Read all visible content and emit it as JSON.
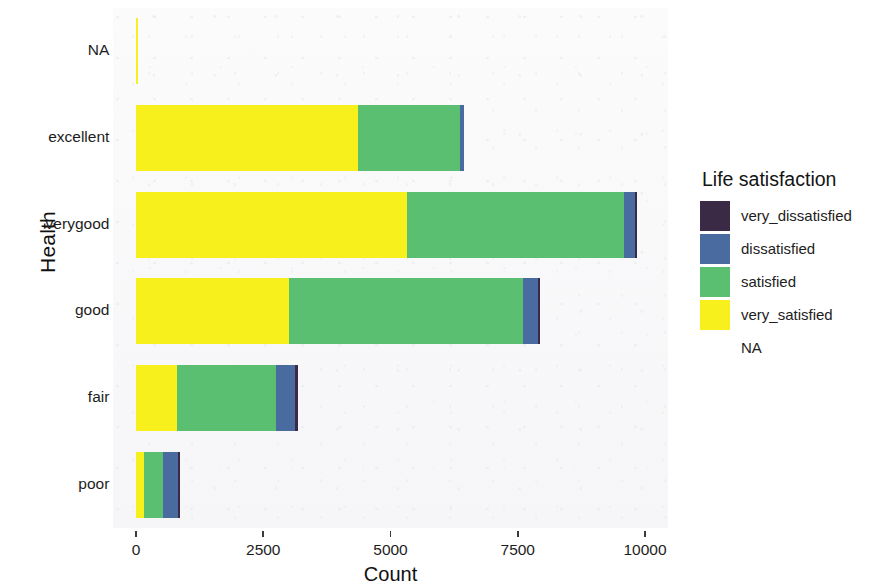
{
  "chart_data": {
    "type": "bar",
    "orientation": "horizontal",
    "stacked": true,
    "title": "",
    "xlabel": "Count",
    "ylabel": "Health",
    "xlim": [
      0,
      10500
    ],
    "xticks": [
      0,
      2500,
      5000,
      7500,
      10000
    ],
    "xticklabels": [
      "0",
      "2500",
      "5000",
      "7500",
      "10000"
    ],
    "categories": [
      "NA",
      "excellent",
      "verygood",
      "good",
      "fair",
      "poor"
    ],
    "grid": false,
    "legend": {
      "title": "Life satisfaction",
      "position": "right",
      "entries": [
        {
          "label": "very_dissatisfied",
          "color": "#3b2a45"
        },
        {
          "label": "dissatisfied",
          "color": "#4a6b9f"
        },
        {
          "label": "satisfied",
          "color": "#5bbf72"
        },
        {
          "label": "very_satisfied",
          "color": "#f7f01c"
        },
        {
          "label": "NA",
          "color": "#ffffff"
        }
      ]
    },
    "series": [
      {
        "name": "very_satisfied",
        "color": "#f7f01c",
        "values": [
          40,
          4360,
          5320,
          3000,
          800,
          160
        ]
      },
      {
        "name": "satisfied",
        "color": "#5bbf72",
        "values": [
          0,
          2000,
          4270,
          4600,
          1960,
          370
        ]
      },
      {
        "name": "dissatisfied",
        "color": "#4a6b9f",
        "values": [
          0,
          80,
          215,
          300,
          355,
          300
        ]
      },
      {
        "name": "very_dissatisfied",
        "color": "#3b2a45",
        "values": [
          0,
          0,
          30,
          40,
          60,
          40
        ]
      },
      {
        "name": "NA",
        "color": "#ffffff",
        "values": [
          0,
          0,
          0,
          0,
          0,
          0
        ]
      }
    ],
    "totals": [
      40,
      6440,
      9835,
      7940,
      3175,
      870
    ]
  },
  "axes": {
    "y_title": "Health",
    "x_title": "Count",
    "y_ticks": [
      {
        "label": "NA"
      },
      {
        "label": "excellent"
      },
      {
        "label": "verygood"
      },
      {
        "label": "good"
      },
      {
        "label": "fair"
      },
      {
        "label": "poor"
      }
    ]
  },
  "style": {
    "panel_background": "#fbfbfc",
    "text_color": "#1d1d1d"
  }
}
